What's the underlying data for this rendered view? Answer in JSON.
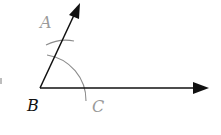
{
  "diagram": {
    "type": "geometric-construction",
    "labels": {
      "A": "A",
      "B": "B",
      "C": "C"
    },
    "points": {
      "B": [
        40,
        88
      ],
      "ray_BA_tip": [
        80,
        3
      ],
      "ray_BC_tip": [
        208,
        88
      ]
    },
    "arc": {
      "center": "B",
      "radius": 46
    },
    "colors": {
      "rays": "#111111",
      "construction_arcs": "#8c8c8c",
      "label_A": "#9a9a9a",
      "label_B": "#111111",
      "label_C": "#9a9a9a",
      "background": "#ffffff"
    }
  }
}
